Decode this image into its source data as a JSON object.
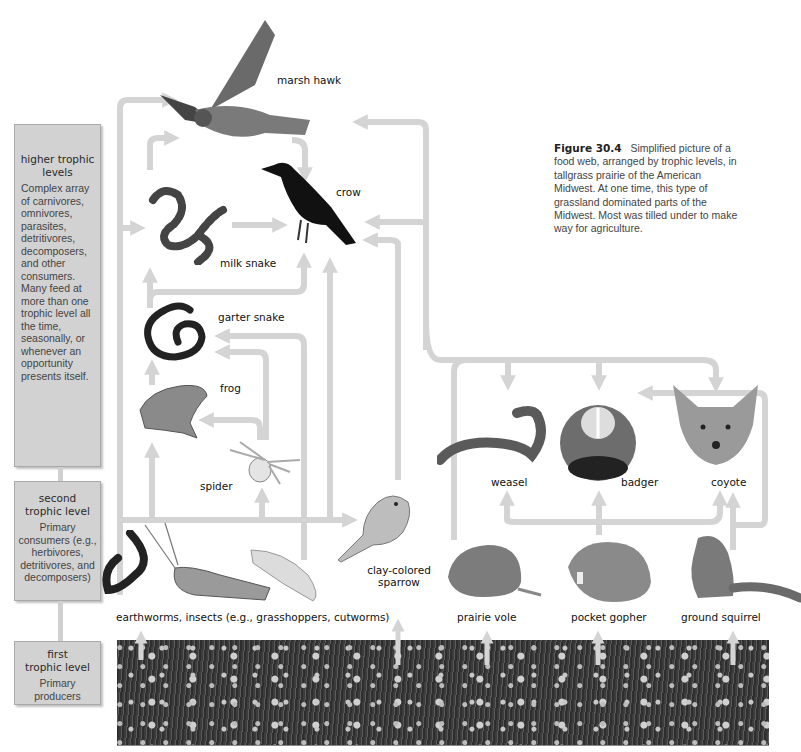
{
  "figure": {
    "number": "Figure 30.4",
    "caption": "Simplified picture of a food web, arranged by trophic levels, in tallgrass prairie of the American Midwest. At one time, this type of grassland dominated parts of the Midwest. Most was tilled under to make way for agriculture."
  },
  "trophic_levels": [
    {
      "title_line1": "higher trophic",
      "title_line2": "levels",
      "description": "Complex array of carnivores, omnivores, parasites, detritivores, decomposers, and other consumers. Many feed at more than one trophic level all the time, seasonally, or whenever an opportunity presents itself."
    },
    {
      "title_line1": "second",
      "title_line2": "trophic level",
      "description": "Primary consumers (e.g., herbivores, detritivores, and decomposers)"
    },
    {
      "title_line1": "first",
      "title_line2": "trophic level",
      "description": "Primary producers"
    }
  ],
  "organisms": {
    "marsh_hawk": "marsh hawk",
    "crow": "crow",
    "milk_snake": "milk snake",
    "garter_snake": "garter snake",
    "frog": "frog",
    "spider": "spider",
    "weasel": "weasel",
    "badger": "badger",
    "coyote": "coyote",
    "clay_colored_sparrow_line1": "clay-colored",
    "clay_colored_sparrow_line2": "sparrow",
    "earthworms_insects": "earthworms, insects (e.g., grasshoppers, cutworms)",
    "prairie_vole": "prairie vole",
    "pocket_gopher": "pocket gopher",
    "ground_squirrel": "ground squirrel"
  },
  "colors": {
    "arrow": "#d4d4d4",
    "level_box": "#d2d2d2",
    "text": "#111111"
  }
}
